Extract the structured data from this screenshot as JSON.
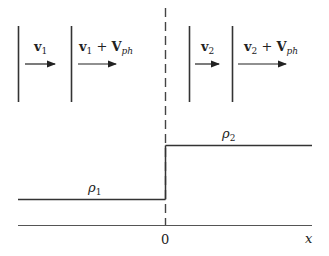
{
  "diagram": {
    "title": "",
    "left_region": {
      "velocity_label_1": {
        "main": "v",
        "sub": "1"
      },
      "velocity_label_2": {
        "main": "v",
        "sub": "1",
        "plus": " + ",
        "main2": "V",
        "sub2": "ph"
      },
      "density_label": {
        "main": "ρ",
        "sub": "1"
      }
    },
    "right_region": {
      "velocity_label_1": {
        "main": "v",
        "sub": "2"
      },
      "velocity_label_2": {
        "main": "v",
        "sub": "2",
        "plus": " + ",
        "main2": "V",
        "sub2": "ph"
      },
      "density_label": {
        "main": "ρ",
        "sub": "2"
      }
    },
    "axis": {
      "origin_label": "0",
      "x_label": "x"
    },
    "colors": {
      "line": "#333333",
      "background": "#ffffff"
    }
  }
}
